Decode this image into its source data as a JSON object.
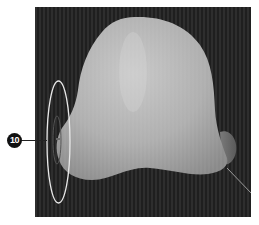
{
  "figure": {
    "callout": {
      "number": "10"
    },
    "viewport": {
      "background_color": "#262626",
      "object": {
        "type": "sculpted-blob",
        "fill_color": "#b5b5b5"
      },
      "gizmo": {
        "type": "rotate-ring",
        "color": "#e8e8e8"
      }
    }
  }
}
